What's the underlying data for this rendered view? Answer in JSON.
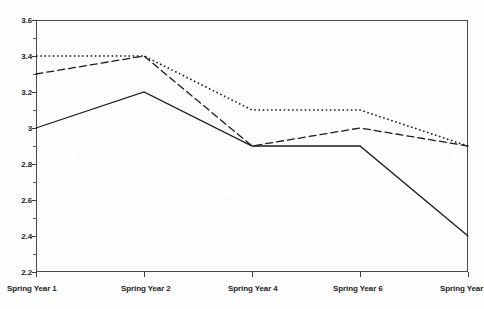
{
  "chart_data": {
    "type": "line",
    "title": "",
    "xlabel": "",
    "ylabel": "",
    "grid": false,
    "legend_position": "none",
    "categories": [
      "Spring Year 1",
      "Spring Year 2",
      "Spring Year 4",
      "Spring Year 6",
      "Spring Year"
    ],
    "x_tick_labels": [
      "Spring Year 1",
      "Spring Year 2",
      "Spring Year 4",
      "Spring Year 6",
      "Spring Year"
    ],
    "y_tick_labels": [
      "3.6",
      "3.4",
      "3.2",
      "3",
      "2.8",
      "2.6",
      "2.4",
      "2.2"
    ],
    "y_tick_values": [
      3.6,
      3.4,
      3.2,
      3.0,
      2.8,
      2.6,
      2.4,
      2.2
    ],
    "ylim": [
      2.2,
      3.6
    ],
    "y_minor_ticks": [
      3.5,
      3.3,
      3.1,
      2.9,
      2.7,
      2.5,
      2.3
    ],
    "series": [
      {
        "name": "dotted-series",
        "style": "dotted",
        "color": "#1d1d1d",
        "values": [
          3.4,
          3.4,
          3.1,
          3.1,
          2.9
        ]
      },
      {
        "name": "dashed-series",
        "style": "dashed",
        "color": "#1d1d1d",
        "values": [
          3.3,
          3.4,
          2.9,
          3.0,
          2.9
        ]
      },
      {
        "name": "solid-series",
        "style": "solid",
        "color": "#1d1d1d",
        "values": [
          3.0,
          3.2,
          2.9,
          2.9,
          2.4
        ]
      }
    ]
  },
  "axis": {
    "y_labels": [
      {
        "text": "3.6",
        "value": 3.6
      },
      {
        "text": "3.4",
        "value": 3.4
      },
      {
        "text": "3.2",
        "value": 3.2
      },
      {
        "text": "3",
        "value": 3.0
      },
      {
        "text": "2.8",
        "value": 2.8
      },
      {
        "text": "2.6",
        "value": 2.6
      },
      {
        "text": "2.4",
        "value": 2.4
      },
      {
        "text": "2.2",
        "value": 2.2
      }
    ],
    "x_labels": [
      {
        "text": "Spring Year 1",
        "index": 0
      },
      {
        "text": "Spring Year 2",
        "index": 1
      },
      {
        "text": "Spring Year 4",
        "index": 2
      },
      {
        "text": "Spring Year 6",
        "index": 3
      },
      {
        "text": "Spring Year",
        "index": 4
      }
    ]
  }
}
